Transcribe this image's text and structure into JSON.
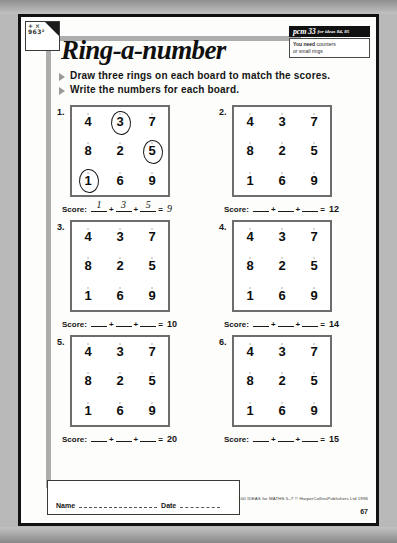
{
  "sheet": {
    "title": "Ring-a-number",
    "banner": {
      "code": "pcm 33",
      "reference": "for ideas 84, 85"
    },
    "you_need": {
      "heading": "You need",
      "line1_rest": "counters",
      "line2": "or small rings"
    },
    "logo": {
      "line1": "+ ×",
      "line2": "963²"
    },
    "instructions": [
      "Draw three rings on each board to match the scores.",
      "Write the numbers for each board."
    ],
    "score_label": "Score:",
    "plus": "+",
    "equals": "=",
    "boards": [
      {
        "number": "1.",
        "grid": [
          [
            "4",
            "3",
            "7"
          ],
          [
            "8",
            "2",
            "5"
          ],
          [
            "1",
            "6",
            "9"
          ]
        ],
        "ringed": [
          [
            false,
            true,
            false
          ],
          [
            false,
            false,
            true
          ],
          [
            true,
            false,
            false
          ]
        ],
        "answers": [
          "1",
          "3",
          "5"
        ],
        "total": "9",
        "filled": true
      },
      {
        "number": "2.",
        "grid": [
          [
            "4",
            "3",
            "7"
          ],
          [
            "8",
            "2",
            "5"
          ],
          [
            "1",
            "6",
            "9"
          ]
        ],
        "ringed": [
          [
            false,
            false,
            false
          ],
          [
            false,
            false,
            false
          ],
          [
            false,
            false,
            false
          ]
        ],
        "answers": [
          "",
          "",
          ""
        ],
        "total": "12",
        "filled": false
      },
      {
        "number": "3.",
        "grid": [
          [
            "4",
            "3",
            "7"
          ],
          [
            "8",
            "2",
            "5"
          ],
          [
            "1",
            "6",
            "9"
          ]
        ],
        "ringed": [
          [
            false,
            false,
            false
          ],
          [
            false,
            false,
            false
          ],
          [
            false,
            false,
            false
          ]
        ],
        "answers": [
          "",
          "",
          ""
        ],
        "total": "10",
        "filled": false
      },
      {
        "number": "4.",
        "grid": [
          [
            "4",
            "3",
            "7"
          ],
          [
            "8",
            "2",
            "5"
          ],
          [
            "1",
            "6",
            "9"
          ]
        ],
        "ringed": [
          [
            false,
            false,
            false
          ],
          [
            false,
            false,
            false
          ],
          [
            false,
            false,
            false
          ]
        ],
        "answers": [
          "",
          "",
          ""
        ],
        "total": "14",
        "filled": false
      },
      {
        "number": "5.",
        "grid": [
          [
            "4",
            "3",
            "7"
          ],
          [
            "8",
            "2",
            "5"
          ],
          [
            "1",
            "6",
            "9"
          ]
        ],
        "ringed": [
          [
            false,
            false,
            false
          ],
          [
            false,
            false,
            false
          ],
          [
            false,
            false,
            false
          ]
        ],
        "answers": [
          "",
          "",
          ""
        ],
        "total": "20",
        "filled": false
      },
      {
        "number": "6.",
        "grid": [
          [
            "4",
            "3",
            "7"
          ],
          [
            "8",
            "2",
            "5"
          ],
          [
            "1",
            "6",
            "9"
          ]
        ],
        "ringed": [
          [
            false,
            false,
            false
          ],
          [
            false,
            false,
            false
          ],
          [
            false,
            false,
            false
          ]
        ],
        "answers": [
          "",
          "",
          ""
        ],
        "total": "15",
        "filled": false
      }
    ],
    "footer": {
      "name_label": "Name",
      "date_label": "Date",
      "copyright": "100 IDEAS for MATHS 5–7  © HarperCollinsPublishers Ltd 1996",
      "page_number": "67"
    }
  }
}
